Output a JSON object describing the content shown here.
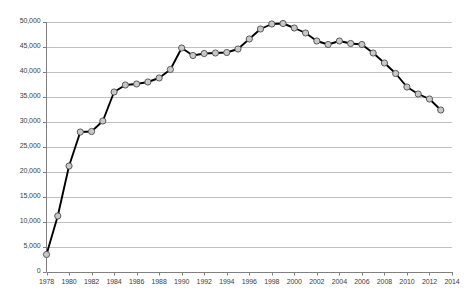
{
  "chart_data": {
    "type": "line",
    "title": "",
    "subtitle": "",
    "xlabel": "",
    "ylabel": "",
    "xlim": [
      1978,
      2014
    ],
    "ylim": [
      0,
      50000
    ],
    "grid": true,
    "grid_axis": "y",
    "legend": false,
    "legend_position": "none",
    "marker": "circle",
    "marker_face_color": "#c8c8c8",
    "marker_edge_color": "#595959",
    "line_color": "#000000",
    "gridline_color": "#c0c0c0",
    "axis_color": "#808080",
    "x": [
      1978,
      1979,
      1980,
      1981,
      1982,
      1983,
      1984,
      1985,
      1986,
      1987,
      1988,
      1989,
      1990,
      1991,
      1992,
      1993,
      1994,
      1995,
      1996,
      1997,
      1998,
      1999,
      2000,
      2001,
      2002,
      2003,
      2004,
      2005,
      2006,
      2007,
      2008,
      2009,
      2010,
      2011,
      2012,
      2013
    ],
    "values": [
      3500,
      11200,
      21200,
      28000,
      28100,
      30200,
      36000,
      37400,
      37600,
      38000,
      38800,
      40500,
      44800,
      43300,
      43700,
      43800,
      43900,
      44600,
      46600,
      48600,
      49600,
      49700,
      48800,
      47800,
      46200,
      45500,
      46200,
      45700,
      45500,
      43800,
      41800,
      39700,
      37000,
      35600,
      34600,
      32400
    ],
    "xticks": [
      1978,
      1980,
      1982,
      1984,
      1986,
      1988,
      1990,
      1992,
      1994,
      1996,
      1998,
      2000,
      2002,
      2004,
      2006,
      2008,
      2010,
      2012,
      2014
    ],
    "xtick_labels": [
      "1978",
      "1980",
      "1982",
      "1984",
      "1986",
      "1988",
      "1990",
      "1992",
      "1994",
      "1996",
      "1998",
      "2000",
      "2002",
      "2004",
      "2006",
      "2008",
      "2010",
      "2012",
      "2014"
    ],
    "yticks": [
      0,
      5000,
      10000,
      15000,
      20000,
      25000,
      30000,
      35000,
      40000,
      45000,
      50000
    ],
    "ytick_labels": [
      "0",
      "5,000",
      "10,000",
      "15,000",
      "20,000",
      "25,000",
      "30,000",
      "35,000",
      "40,000",
      "45,000",
      "50,000"
    ]
  }
}
